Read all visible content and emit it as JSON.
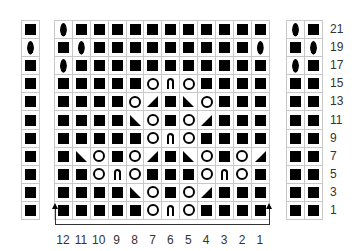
{
  "legend_symbols": {
    "K": "knit-square",
    "O": "yarn-over-circle",
    "L": "leaf-bobble",
    "A": "centered-double-decrease-arch",
    "R": "right-leaning-decrease-triangle",
    "S": "left-leaning-decrease-triangle"
  },
  "main_chart": {
    "column_labels": [
      "12",
      "11",
      "10",
      "9",
      "8",
      "7",
      "6",
      "5",
      "4",
      "3",
      "2",
      "1"
    ],
    "rows": [
      {
        "label": "21",
        "cells": [
          "L",
          "K",
          "K",
          "K",
          "K",
          "K",
          "K",
          "K",
          "K",
          "K",
          "K",
          "K"
        ]
      },
      {
        "label": "19",
        "cells": [
          "K",
          "L",
          "K",
          "K",
          "K",
          "K",
          "K",
          "K",
          "K",
          "K",
          "K",
          "L"
        ]
      },
      {
        "label": "17",
        "cells": [
          "L",
          "K",
          "K",
          "K",
          "K",
          "K",
          "K",
          "K",
          "K",
          "K",
          "K",
          "K"
        ]
      },
      {
        "label": "15",
        "cells": [
          "K",
          "K",
          "K",
          "K",
          "K",
          "O",
          "A",
          "O",
          "K",
          "K",
          "K",
          "K"
        ]
      },
      {
        "label": "13",
        "cells": [
          "K",
          "K",
          "K",
          "K",
          "O",
          "R",
          "K",
          "S",
          "O",
          "K",
          "K",
          "K"
        ]
      },
      {
        "label": "11",
        "cells": [
          "K",
          "K",
          "K",
          "K",
          "S",
          "O",
          "K",
          "O",
          "R",
          "K",
          "K",
          "K"
        ]
      },
      {
        "label": "9",
        "cells": [
          "K",
          "K",
          "K",
          "K",
          "K",
          "O",
          "A",
          "O",
          "K",
          "K",
          "K",
          "K"
        ]
      },
      {
        "label": "7",
        "cells": [
          "K",
          "S",
          "O",
          "K",
          "O",
          "R",
          "K",
          "S",
          "O",
          "K",
          "O",
          "R"
        ]
      },
      {
        "label": "5",
        "cells": [
          "K",
          "K",
          "O",
          "A",
          "O",
          "K",
          "K",
          "K",
          "O",
          "A",
          "O",
          "K"
        ]
      },
      {
        "label": "3",
        "cells": [
          "K",
          "K",
          "K",
          "K",
          "S",
          "O",
          "K",
          "O",
          "R",
          "K",
          "K",
          "K"
        ]
      },
      {
        "label": "1",
        "cells": [
          "K",
          "K",
          "K",
          "K",
          "K",
          "O",
          "A",
          "O",
          "K",
          "K",
          "K",
          "K"
        ]
      }
    ]
  },
  "left_panel": {
    "rows": [
      [
        "K"
      ],
      [
        "L"
      ],
      [
        "K"
      ],
      [
        "K"
      ],
      [
        "K"
      ],
      [
        "K"
      ],
      [
        "K"
      ],
      [
        "K"
      ],
      [
        "K"
      ],
      [
        "K"
      ],
      [
        "K"
      ]
    ]
  },
  "right_panel": {
    "rows": [
      [
        "L",
        "K"
      ],
      [
        "K",
        "L"
      ],
      [
        "L",
        "K"
      ],
      [
        "K",
        "K"
      ],
      [
        "K",
        "K"
      ],
      [
        "K",
        "K"
      ],
      [
        "K",
        "K"
      ],
      [
        "K",
        "K"
      ],
      [
        "K",
        "K"
      ],
      [
        "K",
        "K"
      ],
      [
        "K",
        "K"
      ]
    ]
  },
  "row_labels": [
    "21",
    "19",
    "17",
    "15",
    "13",
    "11",
    "9",
    "7",
    "5",
    "3",
    "1"
  ],
  "repeat_marker": {
    "description": "pattern repeat bracket with arrows at columns 12 and 1"
  },
  "colors": {
    "grid": "#c8c8c8",
    "symbol": "#000000",
    "label": "#333333"
  }
}
